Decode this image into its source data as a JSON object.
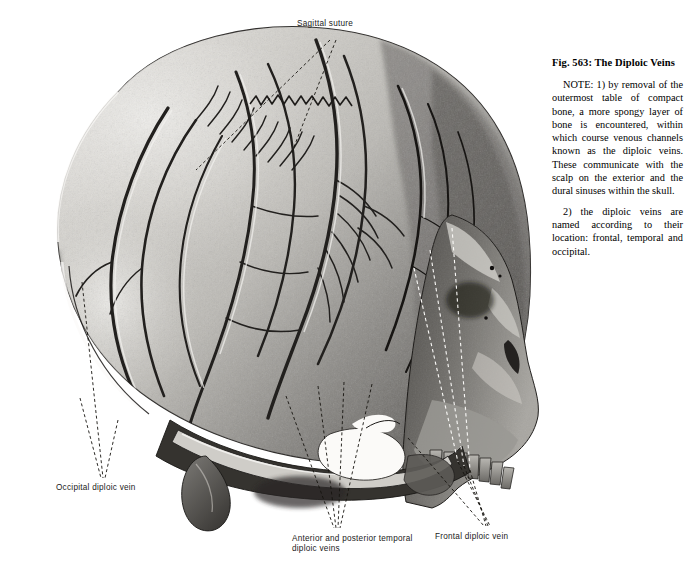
{
  "figure": {
    "caption_title": "Fig. 563: The Diploic Veins",
    "paragraphs": [
      "NOTE: 1) by removal of the outermost table of compact bone, a more spongy layer of bone is encountered, within which course venous channels known as the diploic veins. These communicate with the scalp on the exterior and the dural sinuses within the skull.",
      "2) the diploic veins are named according to their location: frontal, temporal and occipital."
    ],
    "background_color": "#ffffff",
    "ink_color": "#000000"
  },
  "callouts": [
    {
      "id": "sagittal-suture",
      "text": "Sagittal suture",
      "leader_style": "dashed-black",
      "leader_count": 2
    },
    {
      "id": "occipital-diploic-vein",
      "text": "Occipital diploic vein",
      "leader_style": "dashed-black",
      "leader_count": 3
    },
    {
      "id": "temporal-diploic-veins",
      "text": "Anterior and posterior temporal\ndiploic veins",
      "leader_style": "dashed-black",
      "leader_count": 4
    },
    {
      "id": "frontal-diploic-vein",
      "text": "Frontal diploic vein",
      "leader_style": "dashed-mixed-white-black",
      "leader_count": 3
    }
  ]
}
